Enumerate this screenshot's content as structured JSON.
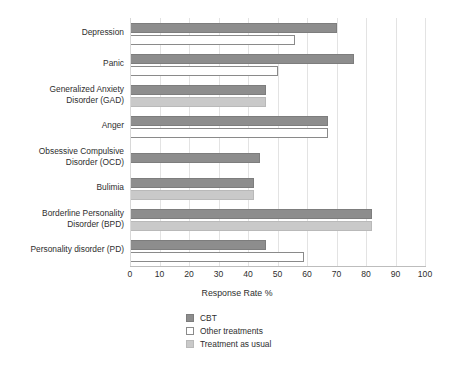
{
  "chart_data": {
    "type": "bar",
    "orientation": "horizontal",
    "title": "",
    "xlabel": "Response Rate %",
    "ylabel": "",
    "xlim": [
      0,
      100
    ],
    "xticks": [
      0,
      10,
      20,
      30,
      40,
      50,
      60,
      70,
      80,
      90,
      100
    ],
    "xtick_labels": [
      "0",
      "10",
      "20",
      "30",
      "40",
      "50",
      "60",
      "70",
      "80",
      "90",
      "100"
    ],
    "grid": true,
    "grid_axis": "x",
    "legend_position": "bottom-center",
    "categories": [
      "Depression",
      "Panic",
      "Generalized Anxiety\nDisorder (GAD)",
      "Anger",
      "Obsessive Compulsive\nDisorder (OCD)",
      "Bulimia",
      "Borderline Personality\nDisorder (BPD)",
      "Personality disorder (PD)"
    ],
    "series": [
      {
        "name": "CBT",
        "color": "#8d8d8d",
        "values": [
          70,
          76,
          46,
          67,
          44,
          42,
          82,
          46
        ]
      },
      {
        "name": "Other treatments",
        "color": "#ffffff",
        "values": [
          56,
          50,
          null,
          67,
          null,
          null,
          null,
          59
        ]
      },
      {
        "name": "Treatment as usual",
        "color": "#c9c9c9",
        "values": [
          null,
          null,
          46,
          null,
          null,
          42,
          82,
          null
        ]
      }
    ],
    "legend": [
      {
        "label": "CBT",
        "swatch": "cbt"
      },
      {
        "label": "Other treatments",
        "swatch": "other"
      },
      {
        "label": "Treatment as usual",
        "swatch": "tau"
      }
    ],
    "colors": {
      "cbt": "#8d8d8d",
      "other_treatments": "#ffffff",
      "treatment_as_usual": "#c9c9c9",
      "gridline": "#e3e3e3",
      "axis": "#bdbdbd",
      "text": "#2e2e2e",
      "background": "#ffffff"
    }
  }
}
